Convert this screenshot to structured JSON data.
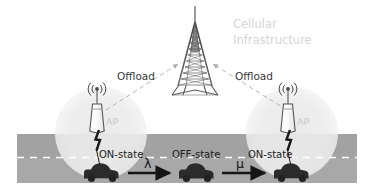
{
  "figure": {
    "background_color": "#ffffff"
  },
  "cellular": {
    "label_line1": "Cellular",
    "label_line2": "Infrastructure",
    "label_color": "#d5d5d5",
    "tower_icon": "cell-tower-icon",
    "tower_color": "#555555"
  },
  "offload_links": [
    {
      "label": "Offload",
      "side": "left"
    },
    {
      "label": "Offload",
      "side": "right"
    }
  ],
  "access_points": [
    {
      "label": "AP",
      "icon": "wifi-access-point-icon",
      "coverage_color": "#efefef",
      "side": "left"
    },
    {
      "label": "AP",
      "icon": "wifi-access-point-icon",
      "coverage_color": "#efefef",
      "side": "right"
    }
  ],
  "road": {
    "surface_color": "#a8a8a8",
    "lane_marking": "dashed-white-line",
    "lane_marking_color": "#ffffff"
  },
  "vehicles": [
    {
      "state_label": "ON-state",
      "icon": "car-icon",
      "connected": true
    },
    {
      "state_label": "OFF-state",
      "icon": "car-icon",
      "connected": false
    },
    {
      "state_label": "ON-state",
      "icon": "car-icon",
      "connected": true
    }
  ],
  "transitions": [
    {
      "symbol": "λ",
      "name": "lambda",
      "direction": "right",
      "from": "ON-state",
      "to": "OFF-state"
    },
    {
      "symbol": "μ",
      "name": "mu",
      "direction": "right",
      "from": "OFF-state",
      "to": "ON-state"
    }
  ],
  "colors": {
    "road": "#a8a8a8",
    "coverage": "#efefef",
    "vehicle": "#2b2b2b",
    "tower": "#555555",
    "faded_text": "#d5d5d5",
    "dark_text": "#1c1c1c",
    "dashed_link": "#b5b5b5"
  }
}
